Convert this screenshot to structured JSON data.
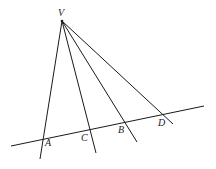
{
  "diagram": {
    "title": "",
    "vertex_label": "V",
    "point_labels": {
      "A": "A",
      "B": "B",
      "C": "C",
      "D": "D"
    }
  }
}
